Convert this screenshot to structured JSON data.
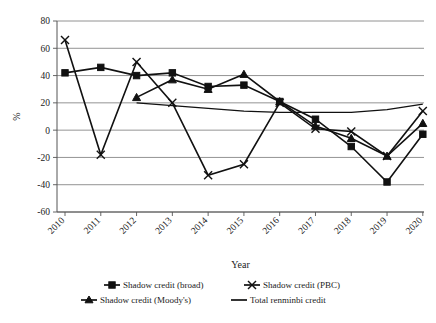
{
  "chart_data": {
    "type": "line",
    "title": "",
    "xlabel": "Year",
    "ylabel": "%",
    "categories": [
      "2010",
      "2011",
      "2012",
      "2013",
      "2014",
      "2015",
      "2016",
      "2017",
      "2018",
      "2019",
      "2020"
    ],
    "x": [
      2010,
      2011,
      2012,
      2013,
      2014,
      2015,
      2016,
      2017,
      2018,
      2019,
      2020
    ],
    "ylim": [
      -60,
      80
    ],
    "yticks": [
      80,
      60,
      40,
      20,
      0,
      -20,
      -40,
      -60
    ],
    "ytick_labels": [
      "80",
      "60",
      "40",
      "20",
      "0",
      "-20",
      "-40",
      "-60"
    ],
    "grid": true,
    "legend_position": "bottom",
    "series": [
      {
        "name": "Shadow credit (broad)",
        "marker": "square",
        "values": [
          42,
          46,
          40,
          42,
          32,
          33,
          21,
          8,
          -12,
          -38,
          -3
        ]
      },
      {
        "name": "Shadow credit (PBC)",
        "marker": "x",
        "values": [
          66,
          -18,
          50,
          20,
          -33,
          -25,
          20,
          1,
          -1,
          -19,
          14
        ]
      },
      {
        "name": "Shadow credit (Moody's)",
        "marker": "triangle",
        "values": [
          null,
          null,
          24,
          37,
          30,
          41,
          21,
          3,
          -6,
          -19,
          5
        ]
      },
      {
        "name": "Total renminbi credit",
        "marker": "none",
        "values": [
          null,
          null,
          20,
          18,
          16,
          14,
          13,
          13,
          13,
          15,
          19
        ]
      }
    ]
  },
  "legend": {
    "items": [
      {
        "label": "Shadow credit (broad)",
        "marker": "square"
      },
      {
        "label": "Shadow credit (PBC)",
        "marker": "x"
      },
      {
        "label": "Shadow credit (Moody's)",
        "marker": "triangle"
      },
      {
        "label": "Total renminbi credit",
        "marker": "line"
      }
    ]
  },
  "colors": {
    "ink": "#111111",
    "grid": "#777777",
    "background": "#ffffff"
  }
}
